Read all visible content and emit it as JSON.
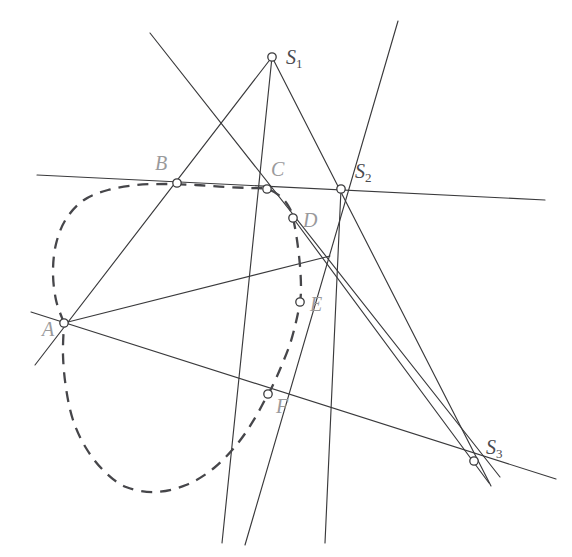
{
  "figure": {
    "background_color": "#ffffff",
    "line_color": "#3a3a3c",
    "conic_color": "#46464a",
    "label_color": "#9a9a9c",
    "marker_fill": "#ffffff"
  },
  "labels": {
    "A": "A",
    "B": "B",
    "C": "C",
    "D": "D",
    "E": "E",
    "F": "F",
    "S1": "S",
    "S1_sub": "1",
    "S2": "S",
    "S2_sub": "2",
    "S3": "S",
    "S3_sub": "3"
  },
  "chart_data": {
    "type": "scatter",
    "xlabel": "",
    "ylabel": "",
    "grid": false,
    "legend": null,
    "xlim": [
      0,
      572
    ],
    "ylim": [
      0,
      557
    ],
    "points": [
      {
        "name": "A",
        "x": 64,
        "y": 323,
        "label": "A",
        "label_dx": -22,
        "label_dy": 8,
        "marker": "circle"
      },
      {
        "name": "B",
        "x": 177,
        "y": 183,
        "label": "B",
        "label_dx": -22,
        "label_dy": -18,
        "marker": "circle"
      },
      {
        "name": "C",
        "x": 267,
        "y": 189,
        "label": "C",
        "label_dx": 4,
        "label_dy": -18,
        "marker": "circle"
      },
      {
        "name": "D",
        "x": 293,
        "y": 218,
        "label": "D",
        "label_dx": 10,
        "label_dy": 4,
        "marker": "circle"
      },
      {
        "name": "E",
        "x": 300,
        "y": 302,
        "label": "E",
        "label_dx": 10,
        "label_dy": 4,
        "marker": "circle"
      },
      {
        "name": "F",
        "x": 268,
        "y": 394,
        "label": "F",
        "label_dx": 8,
        "label_dy": 14,
        "marker": "circle"
      },
      {
        "name": "S1",
        "x": 272,
        "y": 57,
        "label": "S1",
        "label_dx": 14,
        "label_dy": 2,
        "marker": "circle"
      },
      {
        "name": "S2",
        "x": 341,
        "y": 189,
        "label": "S2",
        "label_dx": 14,
        "label_dy": -16,
        "marker": "circle"
      },
      {
        "name": "S3",
        "x": 474,
        "y": 461,
        "label": "S3",
        "label_dx": 12,
        "label_dy": -12,
        "marker": "circle"
      }
    ],
    "lines": [
      {
        "name": "line-B-S2-horizontal",
        "x1": 37,
        "y1": 175,
        "x2": 545,
        "y2": 200,
        "style": "solid"
      },
      {
        "name": "line-A-F-S3",
        "x1": 31,
        "y1": 312,
        "x2": 556,
        "y2": 479,
        "style": "solid"
      },
      {
        "name": "line-S1-B-A",
        "x1": 272,
        "y1": 57,
        "x2": 35,
        "y2": 365,
        "style": "solid"
      },
      {
        "name": "line-S1-C-F",
        "x1": 272,
        "y1": 57,
        "x2": 222,
        "y2": 543,
        "style": "solid"
      },
      {
        "name": "line-S1-S2-S3",
        "x1": 272,
        "y1": 57,
        "x2": 491,
        "y2": 486,
        "style": "solid"
      },
      {
        "name": "line-topleft-through-C-D-S3",
        "x1": 150,
        "y1": 33,
        "x2": 500,
        "y2": 477,
        "style": "solid"
      },
      {
        "name": "line-S2-D-E-bottom",
        "x1": 398,
        "y1": 21,
        "x2": 245,
        "y2": 545,
        "style": "solid"
      },
      {
        "name": "line-S2-E-F-bottom",
        "x1": 341,
        "y1": 189,
        "x2": 325,
        "y2": 543,
        "style": "solid"
      },
      {
        "name": "line-A-E-upper",
        "x1": 64,
        "y1": 323,
        "x2": 330,
        "y2": 256,
        "style": "solid"
      },
      {
        "name": "line-D-E-S3-lower",
        "x1": 293,
        "y1": 218,
        "x2": 489,
        "y2": 483,
        "style": "solid"
      }
    ],
    "conic": {
      "name": "dashed-conic",
      "style": "dashed",
      "description": "Conic (ellipse-like closed curve) passing through the hexagon vertices A, B, C, D, E, F",
      "through_points": [
        "A",
        "B",
        "C",
        "D",
        "E",
        "F"
      ],
      "path_points": [
        [
          64,
          323
        ],
        [
          56,
          300
        ],
        [
          53,
          272
        ],
        [
          56,
          244
        ],
        [
          66,
          219
        ],
        [
          84,
          200
        ],
        [
          108,
          190
        ],
        [
          137,
          185
        ],
        [
          166,
          184
        ],
        [
          196,
          185
        ],
        [
          225,
          187
        ],
        [
          250,
          188
        ],
        [
          267,
          189
        ],
        [
          280,
          196
        ],
        [
          289,
          207
        ],
        [
          293,
          218
        ],
        [
          297,
          240
        ],
        [
          300,
          266
        ],
        [
          301,
          288
        ],
        [
          300,
          302
        ],
        [
          296,
          322
        ],
        [
          290,
          344
        ],
        [
          281,
          367
        ],
        [
          272,
          387
        ],
        [
          268,
          394
        ],
        [
          255,
          418
        ],
        [
          238,
          443
        ],
        [
          214,
          468
        ],
        [
          186,
          485
        ],
        [
          155,
          492
        ],
        [
          126,
          487
        ],
        [
          104,
          471
        ],
        [
          86,
          448
        ],
        [
          73,
          420
        ],
        [
          66,
          388
        ],
        [
          63,
          355
        ],
        [
          64,
          323
        ]
      ]
    }
  }
}
